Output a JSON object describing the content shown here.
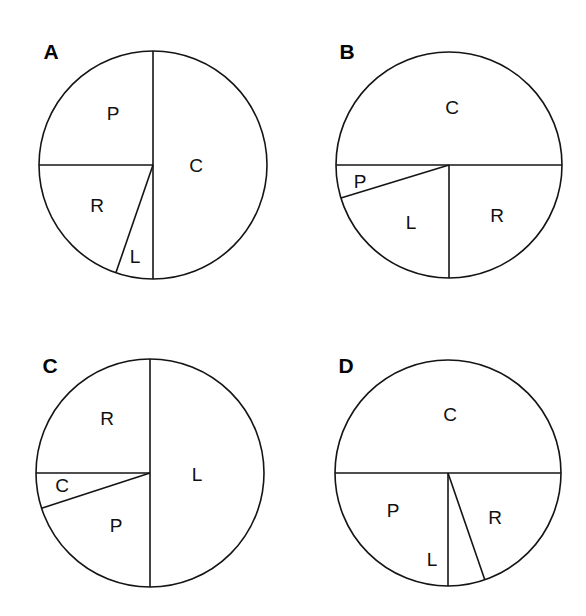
{
  "figure": {
    "background_color": "#ffffff",
    "line_color": "#141414",
    "text_color": "#101010",
    "width": 586,
    "height": 616,
    "panel_count": 4
  },
  "panels": [
    {
      "letter": "A",
      "letter_x": 51,
      "letter_y": 53,
      "center_x": 153,
      "center_y": 165,
      "radius": 114,
      "slice_labels": [
        {
          "text": "P",
          "x": 113,
          "y": 115
        },
        {
          "text": "C",
          "x": 196,
          "y": 167
        },
        {
          "text": "R",
          "x": 97,
          "y": 207
        },
        {
          "text": "L",
          "x": 135,
          "y": 258
        }
      ],
      "slices": [
        {
          "label": "C",
          "start_deg": 0,
          "end_deg": 180,
          "sweep_deg": 180
        },
        {
          "label": "P",
          "start_deg": 270,
          "end_deg": 360,
          "sweep_deg": 90
        },
        {
          "label": "R",
          "start_deg": 199,
          "end_deg": 270,
          "sweep_deg": 71
        },
        {
          "label": "L",
          "start_deg": 180,
          "end_deg": 199,
          "sweep_deg": 19
        }
      ],
      "divider_angles_deg": [
        0,
        180,
        199,
        270
      ]
    },
    {
      "letter": "B",
      "letter_x": 347,
      "letter_y": 53,
      "center_x": 449,
      "center_y": 165,
      "radius": 113,
      "slice_labels": [
        {
          "text": "C",
          "x": 452,
          "y": 109
        },
        {
          "text": "P",
          "x": 360,
          "y": 183
        },
        {
          "text": "L",
          "x": 411,
          "y": 224
        },
        {
          "text": "R",
          "x": 497,
          "y": 217
        }
      ],
      "slices": [
        {
          "label": "C",
          "start_deg": 270,
          "end_deg": 450,
          "sweep_deg": 180
        },
        {
          "label": "R",
          "start_deg": 90,
          "end_deg": 180,
          "sweep_deg": 90
        },
        {
          "label": "L",
          "start_deg": 180,
          "end_deg": 253,
          "sweep_deg": 73
        },
        {
          "label": "P",
          "start_deg": 253,
          "end_deg": 270,
          "sweep_deg": 17
        }
      ],
      "divider_angles_deg": [
        90,
        180,
        253,
        270
      ]
    },
    {
      "letter": "C",
      "letter_x": 50,
      "letter_y": 367,
      "center_x": 150,
      "center_y": 473,
      "radius": 114,
      "slice_labels": [
        {
          "text": "R",
          "x": 107,
          "y": 420
        },
        {
          "text": "L",
          "x": 197,
          "y": 476
        },
        {
          "text": "C",
          "x": 62,
          "y": 487
        },
        {
          "text": "P",
          "x": 116,
          "y": 527
        }
      ],
      "slices": [
        {
          "label": "L",
          "start_deg": 0,
          "end_deg": 180,
          "sweep_deg": 180
        },
        {
          "label": "R",
          "start_deg": 270,
          "end_deg": 360,
          "sweep_deg": 90
        },
        {
          "label": "C",
          "start_deg": 252,
          "end_deg": 270,
          "sweep_deg": 18
        },
        {
          "label": "P",
          "start_deg": 180,
          "end_deg": 252,
          "sweep_deg": 72
        }
      ],
      "divider_angles_deg": [
        0,
        180,
        252,
        270
      ]
    },
    {
      "letter": "D",
      "letter_x": 346,
      "letter_y": 367,
      "center_x": 448,
      "center_y": 473,
      "radius": 113,
      "slice_labels": [
        {
          "text": "C",
          "x": 450,
          "y": 416
        },
        {
          "text": "P",
          "x": 393,
          "y": 512
        },
        {
          "text": "L",
          "x": 432,
          "y": 561
        },
        {
          "text": "R",
          "x": 495,
          "y": 519
        }
      ],
      "slices": [
        {
          "label": "C",
          "start_deg": 270,
          "end_deg": 450,
          "sweep_deg": 180
        },
        {
          "label": "R",
          "start_deg": 90,
          "end_deg": 180,
          "sweep_deg": 90
        },
        {
          "label": "L",
          "start_deg": 161,
          "end_deg": 180,
          "sweep_deg": 19
        },
        {
          "label": "P",
          "start_deg": 270,
          "end_deg": 341,
          "sweep_deg": 71
        }
      ],
      "divider_angles_deg": [
        90,
        161,
        180,
        270
      ]
    }
  ],
  "chart_data": {
    "type": "pie",
    "title": "",
    "xlabel": "",
    "ylabel": "",
    "legend_position": "none",
    "grid": false,
    "categories": [
      "C",
      "P",
      "R",
      "L"
    ],
    "value_unit": "degrees",
    "note": "Four pie diagrams labelled A, B, C, D. Each pie is divided into four wedges labelled C, P, R and L. Slice sizes read off as wedge angles in degrees (total 360).",
    "charts": [
      {
        "panel": "A",
        "labels": [
          "C",
          "P",
          "R",
          "L"
        ],
        "values_deg": [
          180,
          90,
          71,
          19
        ],
        "values_fraction": [
          0.5,
          0.25,
          0.197,
          0.053
        ],
        "slice_order_clockwise_from_12oclock": [
          "C",
          "L",
          "R",
          "P"
        ]
      },
      {
        "panel": "B",
        "labels": [
          "C",
          "R",
          "L",
          "P"
        ],
        "values_deg": [
          180,
          90,
          73,
          17
        ],
        "values_fraction": [
          0.5,
          0.25,
          0.203,
          0.047
        ],
        "slice_order_clockwise_from_12oclock": [
          "C",
          "R",
          "L",
          "P"
        ]
      },
      {
        "panel": "C",
        "labels": [
          "L",
          "R",
          "P",
          "C"
        ],
        "values_deg": [
          180,
          90,
          72,
          18
        ],
        "values_fraction": [
          0.5,
          0.25,
          0.2,
          0.05
        ],
        "slice_order_clockwise_from_12oclock": [
          "L",
          "P",
          "C",
          "R"
        ]
      },
      {
        "panel": "D",
        "labels": [
          "C",
          "R",
          "P",
          "L"
        ],
        "values_deg": [
          180,
          90,
          71,
          19
        ],
        "values_fraction": [
          0.5,
          0.25,
          0.197,
          0.053
        ],
        "slice_order_clockwise_from_12oclock": [
          "C",
          "R",
          "L",
          "P"
        ]
      }
    ]
  }
}
